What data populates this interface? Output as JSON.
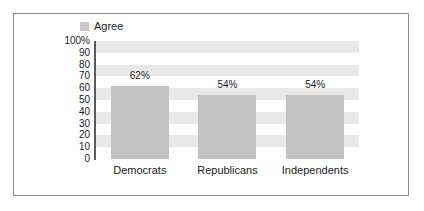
{
  "chart_data": {
    "type": "bar",
    "title": "",
    "subtitle": "",
    "xlabel": "",
    "ylabel": "",
    "categories": [
      "Democrats",
      "Republicans",
      "Independents"
    ],
    "values": [
      62,
      54,
      54
    ],
    "value_labels": [
      "62%",
      "54%",
      "54%"
    ],
    "series": [
      {
        "name": "Agree",
        "color": "#c3c3c3",
        "values": [
          62,
          54,
          54
        ]
      }
    ],
    "ylim": [
      0,
      100
    ],
    "ytick_values": [
      100,
      90,
      80,
      70,
      60,
      50,
      40,
      30,
      20,
      10,
      0
    ],
    "ytick_labels": [
      "100%",
      "90",
      "80",
      "70",
      "60",
      "50",
      "40",
      "30",
      "20",
      "10",
      "0"
    ],
    "grid": false,
    "banded_background": true,
    "band_color": "#e8e8e8",
    "band_ranges": [
      [
        90,
        100
      ],
      [
        70,
        80
      ],
      [
        50,
        60
      ],
      [
        30,
        40
      ],
      [
        10,
        20
      ]
    ],
    "legend": {
      "position": "top-left",
      "entries": [
        {
          "label": "Agree",
          "color": "#c8c8c8"
        }
      ]
    },
    "frame_border_color": "#8d8d8d",
    "axis_line_color": "#5b5b5b",
    "background": "#ffffff"
  },
  "legend": {
    "agree_label": "Agree"
  }
}
